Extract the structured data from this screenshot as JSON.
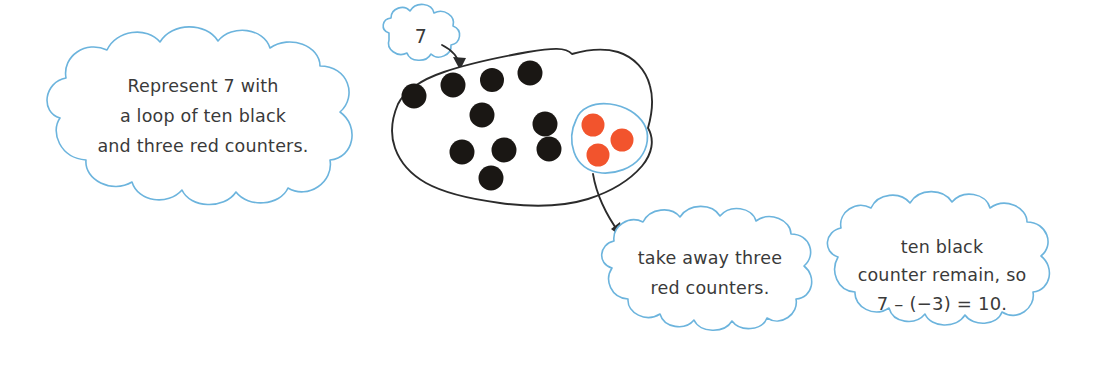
{
  "diagram": {
    "colors": {
      "cloud_outline": "#6cb4dd",
      "text": "#3a3a3a",
      "black_counter": "#1a1714",
      "red_counter": "#f2542d",
      "blob_outline": "#2b2b2b",
      "background": "#ffffff"
    }
  },
  "clouds": {
    "instruction": {
      "lines": [
        "Represent 7 with",
        "a loop of ten black",
        "and three red counters."
      ]
    },
    "value_label": {
      "lines": [
        "7"
      ]
    },
    "take_away": {
      "lines": [
        "take away three",
        "red counters."
      ]
    },
    "result": {
      "lines": [
        "ten black",
        "counter remain, so",
        "7 – (−3) = 10."
      ]
    }
  },
  "counters": {
    "black_label": "black counter",
    "red_label": "red counter",
    "black_count": 10,
    "red_count": 3,
    "black_positions": [
      [
        414,
        96
      ],
      [
        453,
        85
      ],
      [
        492,
        80
      ],
      [
        530,
        73
      ],
      [
        482,
        115
      ],
      [
        545,
        124
      ],
      [
        462,
        152
      ],
      [
        504,
        150
      ],
      [
        549,
        149
      ],
      [
        491,
        178
      ]
    ],
    "red_positions": [
      [
        593,
        125
      ],
      [
        622,
        140
      ],
      [
        598,
        155
      ]
    ]
  },
  "arrows": {
    "from_value_to_blob": "7 points into the counter loop",
    "from_loop_to_takeaway": "red counter loop points to take away callout"
  }
}
